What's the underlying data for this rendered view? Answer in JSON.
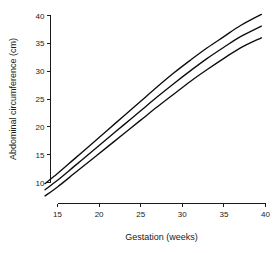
{
  "chart_data": {
    "type": "line",
    "title": "",
    "xlabel": "Gestation (weeks)",
    "ylabel": "Abdominal circumference (cm)",
    "xlim": [
      13.2,
      40.6
    ],
    "ylim": [
      6.6,
      41.2
    ],
    "xticks": [
      15,
      20,
      25,
      30,
      35,
      40
    ],
    "yticks": [
      10,
      15,
      20,
      25,
      30,
      35,
      40
    ],
    "xtick_labels": [
      "15",
      "20",
      "25",
      "30",
      "35",
      "40"
    ],
    "ytick_labels": [
      "10",
      "15",
      "20",
      "25",
      "30",
      "35",
      "40"
    ],
    "grid": false,
    "legend": "none",
    "line_color": "#0d0d0d",
    "background_color": "#ffffff",
    "x": [
      13.5,
      15,
      17,
      19,
      21,
      23,
      25,
      27,
      29,
      31,
      33,
      35,
      37,
      39.5
    ],
    "series": [
      {
        "name": "upper-centile",
        "values": [
          9.8,
          11.6,
          14.2,
          16.8,
          19.4,
          22.0,
          24.6,
          27.2,
          29.7,
          32.0,
          34.2,
          36.2,
          38.2,
          40.2
        ]
      },
      {
        "name": "median-centile",
        "values": [
          8.7,
          10.4,
          12.9,
          15.4,
          17.9,
          20.4,
          22.9,
          25.4,
          27.8,
          30.1,
          32.3,
          34.3,
          36.2,
          38.1
        ]
      },
      {
        "name": "lower-centile",
        "values": [
          7.6,
          9.2,
          11.6,
          14.0,
          16.4,
          18.8,
          21.2,
          23.6,
          25.9,
          28.2,
          30.3,
          32.3,
          34.2,
          36.0
        ]
      }
    ]
  },
  "axes": {
    "x_title": "Gestation (weeks)",
    "y_title": "Abdominal circumference (cm)"
  }
}
